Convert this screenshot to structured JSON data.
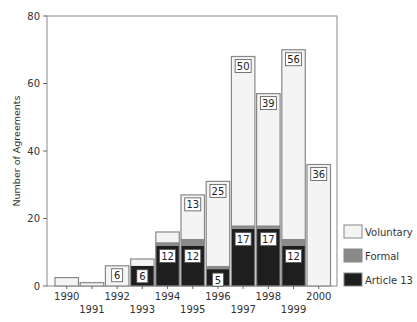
{
  "chart_data": {
    "type": "bar",
    "stacked": true,
    "title": "",
    "xlabel": "",
    "ylabel": "Number of Agreements",
    "ylim": [
      0,
      80
    ],
    "yticks": [
      0,
      20,
      40,
      60,
      80
    ],
    "grid": false,
    "legend_position": "right-bottom",
    "categories": [
      "1990",
      "1991",
      "1992",
      "1993",
      "1994",
      "1995",
      "1996",
      "1997",
      "1998",
      "1999",
      "2000"
    ],
    "series": [
      {
        "name": "Article 13",
        "color": "#1e1e1e",
        "values": [
          0,
          0,
          0,
          6,
          12,
          12,
          5,
          17,
          17,
          12,
          0
        ]
      },
      {
        "name": "Formal",
        "color": "#8a8a8a",
        "values": [
          0,
          0,
          0,
          0,
          1,
          2,
          1,
          1,
          1,
          2,
          0
        ]
      },
      {
        "name": "Voluntary",
        "color": "#f4f4f4",
        "values": [
          2.5,
          1,
          6,
          2,
          3,
          13,
          25,
          50,
          39,
          56,
          36
        ]
      }
    ],
    "data_labels": [
      {
        "category": "1992",
        "series": "Voluntary",
        "text": "6"
      },
      {
        "category": "1993",
        "series": "Article 13",
        "text": "6"
      },
      {
        "category": "1994",
        "series": "Article 13",
        "text": "12"
      },
      {
        "category": "1995",
        "series": "Article 13",
        "text": "12"
      },
      {
        "category": "1995",
        "series": "Voluntary",
        "text": "13"
      },
      {
        "category": "1996",
        "series": "Article 13",
        "text": "5"
      },
      {
        "category": "1996",
        "series": "Voluntary",
        "text": "25"
      },
      {
        "category": "1997",
        "series": "Article 13",
        "text": "17"
      },
      {
        "category": "1997",
        "series": "Voluntary",
        "text": "50"
      },
      {
        "category": "1998",
        "series": "Article 13",
        "text": "17"
      },
      {
        "category": "1998",
        "series": "Voluntary",
        "text": "39"
      },
      {
        "category": "1999",
        "series": "Article 13",
        "text": "12"
      },
      {
        "category": "1999",
        "series": "Voluntary",
        "text": "56"
      },
      {
        "category": "2000",
        "series": "Voluntary",
        "text": "36"
      }
    ],
    "legend": [
      "Voluntary",
      "Formal",
      "Article 13"
    ]
  }
}
